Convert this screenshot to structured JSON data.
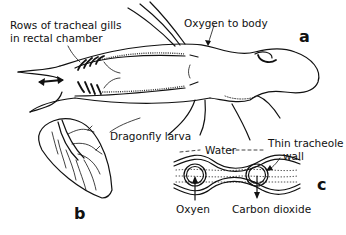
{
  "figure": {
    "panel_a": {
      "letter": "a",
      "labels": {
        "gills": [
          "Rows of tracheal gills",
          "in rectal chamber"
        ],
        "oxygen": "Oxygen to body",
        "larva": "Dragonfly larva"
      }
    },
    "panel_b": {
      "letter": "b"
    },
    "panel_c": {
      "letter": "c",
      "labels": {
        "water": "Water",
        "wall": [
          "Thin tracheole",
          "wall"
        ],
        "oxygen": "Oxyen",
        "co2": "Carbon dioxide"
      }
    }
  },
  "colors": {
    "ink": "#111111",
    "background": "#ffffff"
  }
}
